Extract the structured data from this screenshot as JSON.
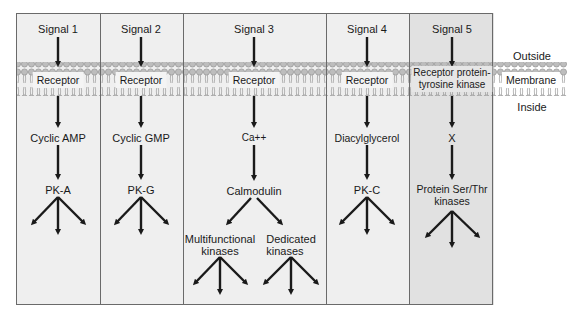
{
  "membrane": {
    "outside_label": "Outside",
    "membrane_label": "Membrane",
    "inside_label": "Inside"
  },
  "columns": [
    {
      "signal": "Signal 1",
      "receptor": "Receptor",
      "second_messenger": "Cyclic AMP",
      "kinase": "PK-A"
    },
    {
      "signal": "Signal 2",
      "receptor": "Receptor",
      "second_messenger": "Cyclic GMP",
      "kinase": "PK-G"
    },
    {
      "signal": "Signal 3",
      "receptor": "Receptor",
      "second_messenger": "Ca++",
      "mediator": "Calmodulin",
      "branches": [
        {
          "line1": "Multifunctional",
          "line2": "kinases"
        },
        {
          "line1": "Dedicated",
          "line2": "kinases"
        }
      ]
    },
    {
      "signal": "Signal 4",
      "receptor": "Receptor",
      "second_messenger": "Diacylglycerol",
      "kinase": "PK-C"
    },
    {
      "signal": "Signal 5",
      "receptor_line1": "Receptor protein-",
      "receptor_line2": "tyrosine kinase",
      "second_messenger": "X",
      "kinase_line1": "Protein Ser/Thr",
      "kinase_line2": "kinases"
    }
  ],
  "colors": {
    "panel_light": "#efefef",
    "panel_dark": "#e1e1e1",
    "border": "#6a6a6a",
    "arrow": "#1a1a1a",
    "lipid_head": "#b8b8b8"
  }
}
